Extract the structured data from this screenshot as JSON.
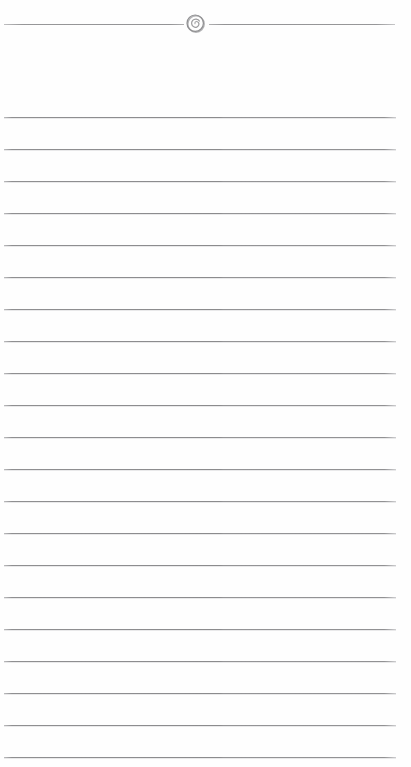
{
  "document": {
    "type": "lined-paper-page",
    "title": "",
    "page_width": 411,
    "page_height": 767,
    "background_color": "#fefefe",
    "content_text": "",
    "is_blank": true
  },
  "header": {
    "divider": {
      "name": "header-divider",
      "y": 24,
      "color": "#8e8e90",
      "left_segment": {
        "x": 4,
        "width": 180
      },
      "right_segment": {
        "x": 209,
        "width": 186
      }
    },
    "ornament": {
      "name": "spiral-ornament-icon",
      "icon": "spiral-swirl-icon",
      "center_x": 196,
      "center_y": 24,
      "diameter": 22,
      "color": "#a6a6a8"
    }
  },
  "ruled_area": {
    "name": "ruled-lines",
    "line_color": "#8f8f91",
    "line_left": 4,
    "line_width": 392,
    "first_line_y": 117,
    "line_spacing": 32,
    "line_count": 21,
    "line_y_positions": [
      117,
      149,
      181,
      213,
      245,
      277,
      309,
      341,
      373,
      405,
      437,
      469,
      501,
      533,
      565,
      597,
      629,
      661,
      693,
      725,
      757
    ]
  }
}
